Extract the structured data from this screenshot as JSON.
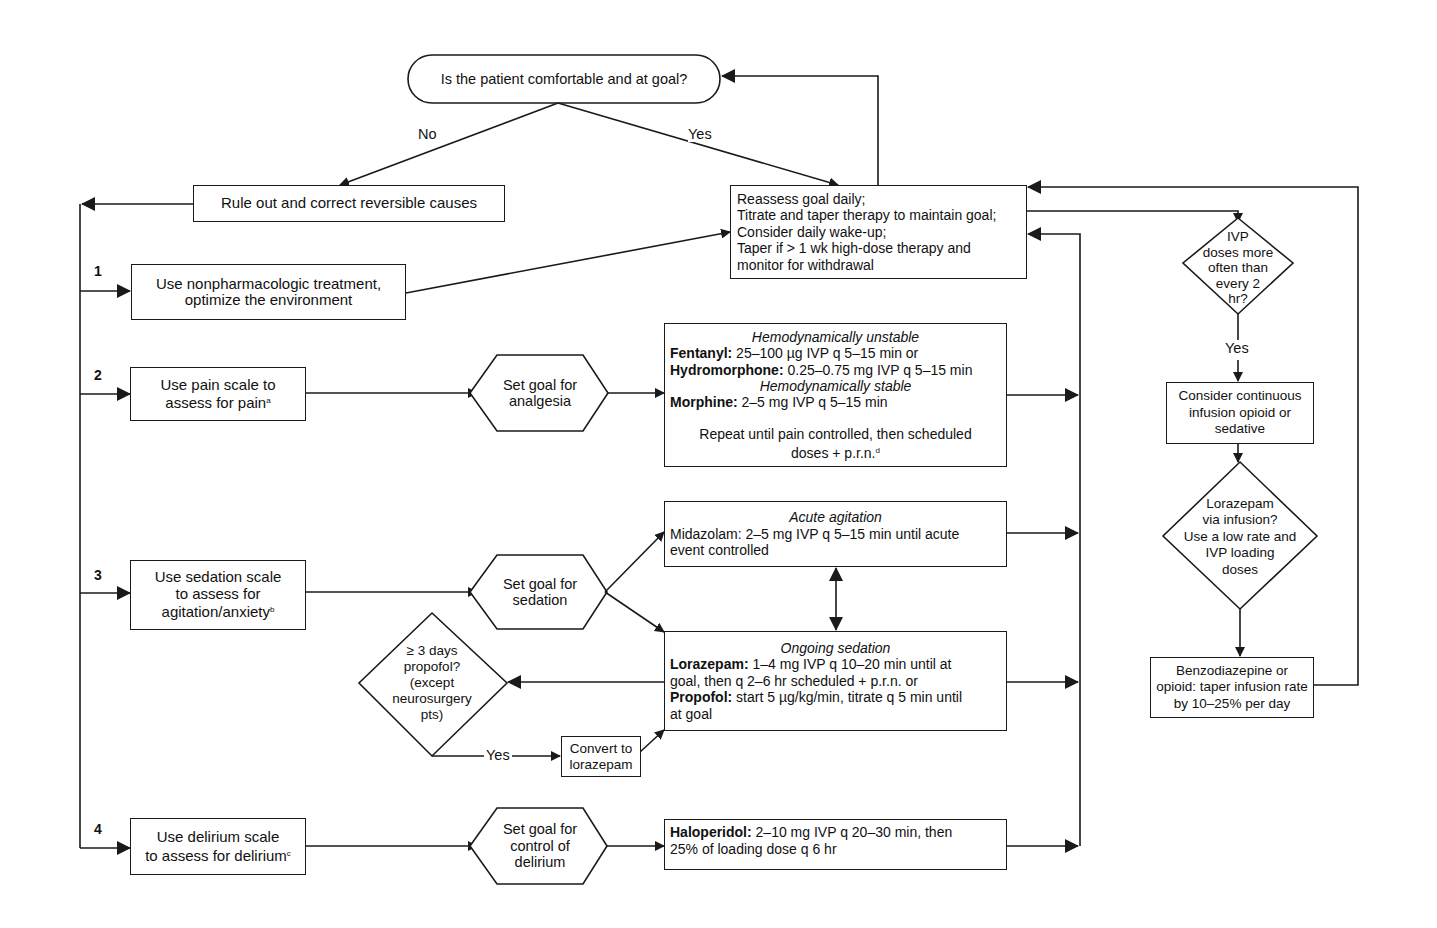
{
  "start": {
    "question": "Is the patient comfortable and at goal?",
    "no_label": "No",
    "yes_label": "Yes"
  },
  "rule_out": "Rule out and correct reversible causes",
  "reassess": {
    "lines": [
      "Reassess goal daily;",
      "Titrate and taper therapy to maintain goal;",
      "Consider daily wake-up;",
      "Taper if > 1 wk high-dose therapy and",
      "monitor for withdrawal"
    ]
  },
  "steps": [
    {
      "number": "1",
      "lines": [
        "Use nonpharmacologic treatment,",
        "optimize the environment"
      ]
    },
    {
      "number": "2",
      "lines": [
        "Use pain scale to",
        "assess for pain"
      ],
      "footnote": "a"
    },
    {
      "number": "3",
      "lines": [
        "Use sedation scale",
        "to assess for",
        "agitation/anxiety"
      ],
      "footnote": "b"
    },
    {
      "number": "4",
      "lines": [
        "Use delirium scale",
        "to assess for delirium"
      ],
      "footnote": "c"
    }
  ],
  "goals": {
    "analgesia": [
      "Set goal for",
      "analgesia"
    ],
    "sedation": [
      "Set goal for",
      "sedation"
    ],
    "delirium": [
      "Set goal for",
      "control of",
      "delirium"
    ]
  },
  "analgesia_box": {
    "heading_unstable": "Hemodynamically unstable",
    "fentanyl_name": "Fentanyl:",
    "fentanyl_dose": " 25–100 µg IVP q 5–15 min or",
    "hydromorphone_name": "Hydromorphone:",
    "hydromorphone_dose": " 0.25–0.75 mg IVP q 5–15 min",
    "heading_stable": "Hemodynamically stable",
    "morphine_name": "Morphine:",
    "morphine_dose": " 2–5 mg IVP q 5–15 min",
    "repeat_line1": "Repeat until pain controlled, then scheduled",
    "repeat_line2": "doses + p.r.n.",
    "footnote": "d"
  },
  "acute_box": {
    "heading": "Acute agitation",
    "line1": "Midazolam: 2–5 mg IVP q 5–15 min until acute",
    "line2": "event controlled"
  },
  "ongoing_box": {
    "heading": "Ongoing sedation",
    "lorazepam_name": "Lorazepam:",
    "lorazepam_dose": " 1–4 mg IVP q 10–20 min until at",
    "lorazepam_line2": "goal, then q 2–6 hr scheduled + p.r.n. or",
    "propofol_name": "Propofol:",
    "propofol_dose": " start 5 µg/kg/min, titrate q 5 min until",
    "propofol_line2": "at goal"
  },
  "propofol_decision": {
    "lines": [
      "≥ 3 days",
      "propofol?",
      "(except",
      "neurosurgery",
      "pts)"
    ],
    "yes_label": "Yes"
  },
  "convert": [
    "Convert to",
    "lorazepam"
  ],
  "haloperidol_box": {
    "name": "Haloperidol:",
    "dose": " 2–10 mg IVP q 20–30 min, then",
    "line2": "25% of loading dose q 6 hr"
  },
  "right_column": {
    "ivp_decision": [
      "IVP",
      "doses more",
      "often than",
      "every 2",
      "hr?"
    ],
    "yes_label": "Yes",
    "consider_infusion": [
      "Consider continuous",
      "infusion opioid or",
      "sedative"
    ],
    "lorazepam_decision": [
      "Lorazepam",
      "via infusion?",
      "Use a low rate and",
      "IVP loading",
      "doses"
    ],
    "taper_box": [
      "Benzodiazepine or",
      "opioid: taper infusion rate",
      "by 10–25% per day"
    ]
  },
  "colors": {
    "line": "#1a1a1a",
    "background": "#ffffff",
    "text": "#111111"
  }
}
